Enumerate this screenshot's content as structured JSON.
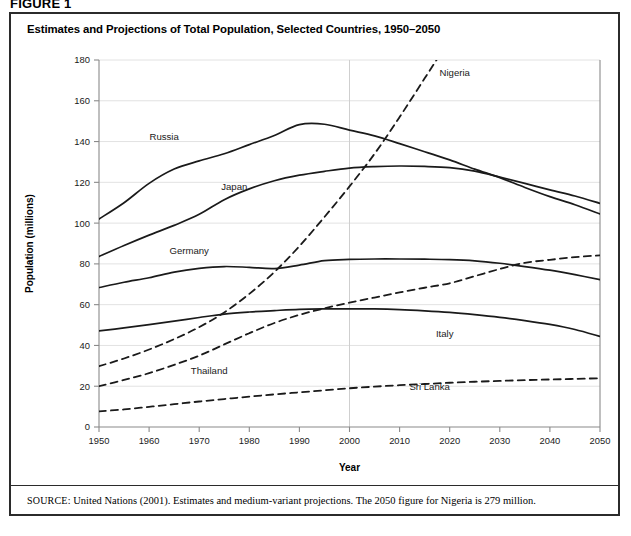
{
  "figure_label": "FIGURE 1",
  "chart_title": "Estimates and Projections of Total Population, Selected Countries, 1950–2050",
  "source_keyword": "SOURCE:",
  "source_text": " United Nations (2001). Estimates and medium-variant projections. The 2050 figure for Nigeria is 279 million.",
  "axes": {
    "x_title": "Year",
    "y_title": "Population (millions)",
    "x_ticks": [
      "1950",
      "1960",
      "1970",
      "1980",
      "1990",
      "2000",
      "2010",
      "2020",
      "2030",
      "2040",
      "2050"
    ],
    "y_ticks": [
      "0",
      "20",
      "40",
      "60",
      "80",
      "100",
      "120",
      "140",
      "160",
      "180"
    ]
  },
  "chart_data": {
    "type": "line",
    "title": "Estimates and Projections of Total Population, Selected Countries, 1950–2050",
    "xlabel": "Year",
    "ylabel": "Population (millions)",
    "xlim": [
      1950,
      2050
    ],
    "ylim": [
      0,
      180
    ],
    "grid": true,
    "legend": "inline-labels",
    "x": [
      1950,
      1955,
      1960,
      1965,
      1970,
      1975,
      1980,
      1985,
      1990,
      1995,
      2000,
      2005,
      2010,
      2015,
      2020,
      2025,
      2030,
      2035,
      2040,
      2045,
      2050
    ],
    "series": [
      {
        "name": "Russia",
        "style": "solid",
        "label_x": 1963,
        "label_y": 141,
        "values": [
          102.0,
          110.0,
          119.5,
          126.5,
          130.5,
          134.0,
          138.5,
          143.0,
          148.3,
          148.5,
          145.6,
          142.8,
          139.0,
          135.0,
          131.0,
          126.5,
          122.3,
          117.5,
          113.0,
          109.0,
          104.5
        ]
      },
      {
        "name": "Japan",
        "style": "solid",
        "label_x": 1977,
        "label_y": 116,
        "values": [
          83.6,
          89.0,
          94.1,
          98.9,
          104.3,
          111.5,
          116.8,
          120.8,
          123.5,
          125.4,
          127.0,
          127.7,
          128.0,
          127.8,
          127.2,
          125.5,
          122.6,
          119.5,
          116.3,
          113.3,
          109.7
        ]
      },
      {
        "name": "Germany",
        "style": "solid",
        "label_x": 1968,
        "label_y": 85,
        "values": [
          68.4,
          71.0,
          73.2,
          76.0,
          77.8,
          78.7,
          78.3,
          77.7,
          79.4,
          81.6,
          82.2,
          82.4,
          82.4,
          82.3,
          82.1,
          81.5,
          80.3,
          78.7,
          76.9,
          74.7,
          72.3
        ]
      },
      {
        "name": "Italy",
        "style": "solid",
        "label_x": 2019,
        "label_y": 44,
        "values": [
          47.1,
          48.6,
          50.2,
          51.9,
          53.7,
          55.4,
          56.4,
          57.1,
          57.7,
          57.9,
          57.9,
          57.9,
          57.6,
          57.0,
          56.2,
          55.1,
          53.8,
          52.2,
          50.3,
          47.8,
          44.4
        ]
      },
      {
        "name": "Nigeria",
        "style": "dashed",
        "label_x": 2021,
        "label_y": 172,
        "truncated_above_axis": true,
        "note_2050_value": 279,
        "values": [
          29.8,
          33.6,
          38.0,
          43.1,
          49.0,
          56.2,
          65.3,
          76.0,
          88.7,
          103.0,
          118.0,
          134.0,
          152.0,
          171.0,
          190.0,
          209.0,
          228.0,
          245.0,
          258.0,
          270.0,
          279.0
        ]
      },
      {
        "name": "Thailand",
        "style": "dashed",
        "label_x": 1972,
        "label_y": 26,
        "values": [
          20.0,
          23.1,
          26.4,
          30.5,
          35.0,
          40.5,
          46.0,
          51.0,
          55.0,
          58.2,
          61.0,
          63.5,
          66.0,
          68.3,
          70.5,
          74.0,
          77.5,
          80.5,
          82.0,
          83.3,
          84.2
        ]
      },
      {
        "name": "Sri Lanka",
        "style": "dashed",
        "label_x": 2016,
        "label_y": 18,
        "values": [
          7.7,
          8.6,
          9.9,
          11.2,
          12.5,
          13.7,
          14.9,
          16.0,
          17.0,
          18.0,
          19.0,
          19.8,
          20.5,
          21.1,
          21.7,
          22.2,
          22.6,
          23.0,
          23.3,
          23.6,
          23.9
        ]
      }
    ]
  }
}
